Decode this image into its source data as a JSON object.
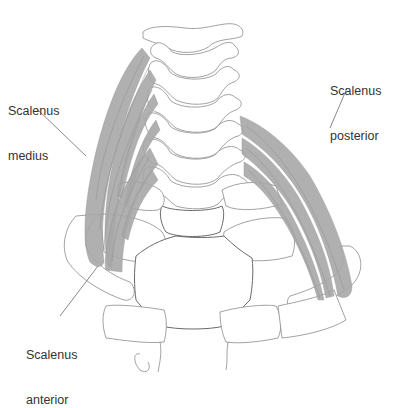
{
  "diagram": {
    "labels": [
      {
        "id": "scalenus-medius",
        "line1": "Scalenus",
        "line2": "medius",
        "x": 8,
        "y": 74
      },
      {
        "id": "scalenus-posterior",
        "line1": "Scalenus",
        "line2": "posterior",
        "x": 330,
        "y": 54
      },
      {
        "id": "scalenus-anterior",
        "line1": "Scalenus",
        "line2": "anterior",
        "x": 26,
        "y": 318
      }
    ],
    "colors": {
      "background": "#ffffff",
      "bone_outline": "#8a8a8a",
      "muscle_fill": "#a8a8a8",
      "text": "#333333",
      "leader_line": "#6b6b6b"
    }
  }
}
